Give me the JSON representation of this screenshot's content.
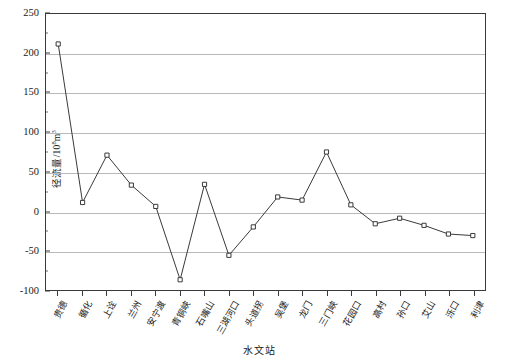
{
  "chart_data": {
    "type": "line",
    "title": "",
    "xlabel": "水文站",
    "ylabel": "径流量/10⁸m³",
    "ylabel_base": "径流量/10",
    "ylabel_exp": "8",
    "ylabel_unit": "m³",
    "ylim": [
      -100,
      250
    ],
    "yticks": [
      -100,
      -50,
      0,
      50,
      100,
      150,
      200,
      250
    ],
    "ytick_labels": [
      "-100",
      "-50",
      "0",
      "50",
      "100",
      "150",
      "200",
      "250"
    ],
    "y_minor_step": 25,
    "grid": "horizontal",
    "legend": "none",
    "marker": "open-square",
    "line_color": "#3a3a3a",
    "grid_color": "#b9b9b9",
    "categories": [
      "贵德",
      "循化",
      "上诠",
      "兰州",
      "安宁渡",
      "青铜峡",
      "石嘴山",
      "三湖河口",
      "头道拐",
      "吴堡",
      "龙门",
      "三门峡",
      "花园口",
      "高村",
      "孙口",
      "艾山",
      "泺口",
      "利津"
    ],
    "values": [
      212,
      11,
      71,
      33,
      6,
      -87,
      34,
      -56,
      -20,
      18,
      14,
      75,
      8,
      -16,
      -9,
      -18,
      -29,
      -31
    ]
  },
  "axis": {
    "x_title": "水文站"
  }
}
